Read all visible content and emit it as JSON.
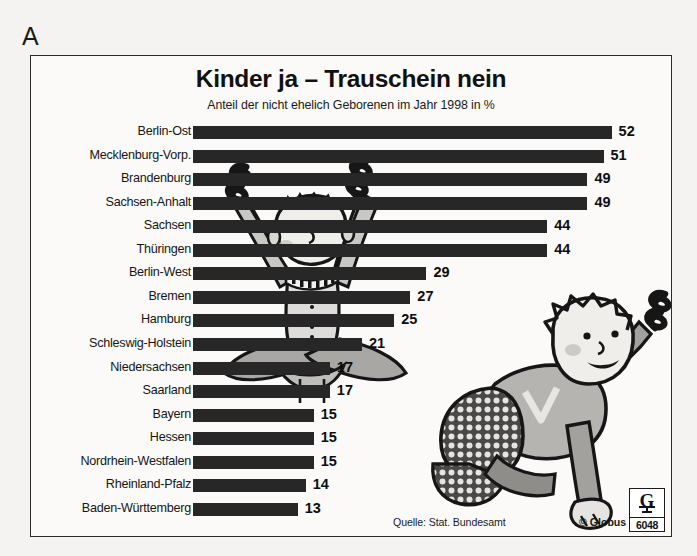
{
  "annotation": {
    "letter": "A"
  },
  "header": {
    "title": "Kinder ja – Trauschein nein",
    "subtitle": "Anteil der nicht ehelich Geborenen im Jahr 1998 in %"
  },
  "footer": {
    "source": "Quelle: Stat. Bundesamt",
    "copyright": "© Globus",
    "logo_letter": "G",
    "logo_number": "6048"
  },
  "illustrations": [
    {
      "name": "sitting-baby-with-paragraph-symbols"
    },
    {
      "name": "crawling-toddler-reaching-for-paragraph-symbol"
    }
  ],
  "chart_data": {
    "type": "bar",
    "orientation": "horizontal",
    "title": "Kinder ja – Trauschein nein",
    "subtitle": "Anteil der nicht ehelich Geborenen im Jahr 1998 in %",
    "xlabel": "",
    "ylabel": "",
    "unit": "%",
    "year": 1998,
    "source": "Quelle: Stat. Bundesamt",
    "grid": false,
    "legend": false,
    "xlim": [
      0,
      52
    ],
    "bar_color": "#272727",
    "categories": [
      "Berlin-Ost",
      "Mecklenburg-Vorp.",
      "Brandenburg",
      "Sachsen-Anhalt",
      "Sachsen",
      "Thüringen",
      "Berlin-West",
      "Bremen",
      "Hamburg",
      "Schleswig-Holstein",
      "Niedersachsen",
      "Saarland",
      "Bayern",
      "Hessen",
      "Nordrhein-Westfalen",
      "Rheinland-Pfalz",
      "Baden-Württemberg"
    ],
    "values": [
      52,
      51,
      49,
      49,
      44,
      44,
      29,
      27,
      25,
      21,
      17,
      17,
      15,
      15,
      15,
      14,
      13
    ]
  }
}
